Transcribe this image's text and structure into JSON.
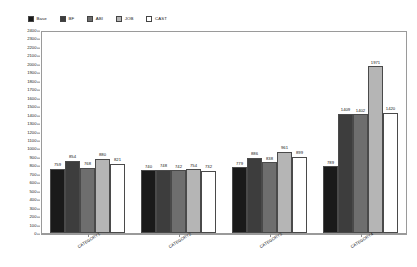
{
  "chart_data": {
    "type": "bar",
    "title": "",
    "xlabel": "",
    "ylabel": "",
    "ylim": [
      0,
      2400
    ],
    "ytick_step": 100,
    "grid": false,
    "legend_position": "top-left",
    "categories": [
      "CATEGORY1",
      "CATEGORY2",
      "CATEGORY3",
      "CATEGORY4"
    ],
    "series": [
      {
        "name": "Base",
        "color": "#1a1a1a",
        "values": [
          759,
          740,
          779,
          789
        ]
      },
      {
        "name": "BF",
        "color": "#3d3d3d",
        "values": [
          854,
          748,
          886,
          1409
        ]
      },
      {
        "name": "ABI",
        "color": "#6e6e6e",
        "values": [
          768,
          742,
          838,
          1402
        ]
      },
      {
        "name": "JOB",
        "color": "#b5b5b5",
        "values": [
          880,
          754,
          961,
          1971
        ]
      },
      {
        "name": "CAST",
        "color": "#ffffff",
        "values": [
          821,
          732,
          899,
          1420
        ]
      }
    ],
    "yticks": [
      "2400",
      "2300",
      "2200",
      "2100",
      "2000",
      "1900",
      "1800",
      "1700",
      "1600",
      "1500",
      "1400",
      "1300",
      "1200",
      "1100",
      "1000",
      "900",
      "800",
      "700",
      "600",
      "500",
      "400",
      "300",
      "200",
      "100",
      "0"
    ]
  },
  "legend": {
    "items": [
      {
        "label": "Base",
        "color": "#1a1a1a"
      },
      {
        "label": "BF",
        "color": "#3d3d3d"
      },
      {
        "label": "ABI",
        "color": "#6e6e6e"
      },
      {
        "label": "JOB",
        "color": "#b5b5b5"
      },
      {
        "label": "CAST",
        "color": "#ffffff"
      }
    ]
  },
  "axis": {
    "y_title": "",
    "y_max": 2400,
    "y_min": 0
  }
}
